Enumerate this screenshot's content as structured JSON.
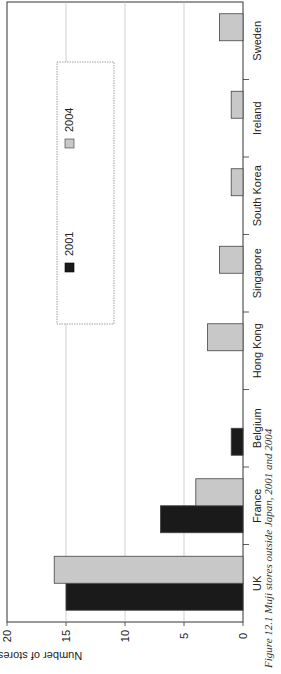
{
  "chart_data": {
    "type": "bar",
    "orientation": "rotated-90 (vertical bar chart printed sideways)",
    "title": "",
    "caption": "Figure 12.1  Muji stores outside Japan, 2001 and 2004",
    "xlabel": "",
    "ylabel": "Number of stores",
    "ylim": [
      0,
      20
    ],
    "yticks": [
      "0",
      "5",
      "10",
      "15",
      "20"
    ],
    "grid": true,
    "legend_position": "inside, upper area",
    "categories": [
      "UK",
      "France",
      "Belgium",
      "Hong Kong",
      "Singapore",
      "South Korea",
      "Ireland",
      "Sweden"
    ],
    "series": [
      {
        "name": "2001",
        "color": "#1a1a1a",
        "values": [
          15,
          7,
          1,
          0,
          0,
          0,
          0,
          0
        ]
      },
      {
        "name": "2004",
        "color": "#c8c8c8",
        "values": [
          16,
          4,
          0,
          3,
          2,
          1,
          1,
          2
        ]
      }
    ]
  },
  "legend": {
    "items": [
      {
        "label": "2001",
        "color": "#1a1a1a"
      },
      {
        "label": "2004",
        "color": "#c8c8c8"
      }
    ]
  },
  "axis": {
    "label": "Number of stores",
    "ticks": [
      "0",
      "5",
      "10",
      "15",
      "20"
    ]
  },
  "caption": "Figure 12.1  Muji stores outside Japan, 2001 and 2004"
}
